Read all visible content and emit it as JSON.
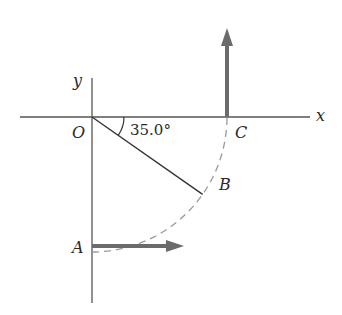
{
  "diagram": {
    "labels": {
      "x_axis": "x",
      "y_axis": "y",
      "origin": "O",
      "point_a": "A",
      "point_b": "B",
      "point_c": "C",
      "angle": "35.0°"
    },
    "geometry": {
      "origin_px": [
        92,
        117
      ],
      "radius_px": 135,
      "angle_deg": 35.0
    },
    "colors": {
      "axis": "#555555",
      "arrow": "#6b6b6b",
      "dashed_arc": "#9a9a9a",
      "radius_line": "#333333"
    }
  }
}
